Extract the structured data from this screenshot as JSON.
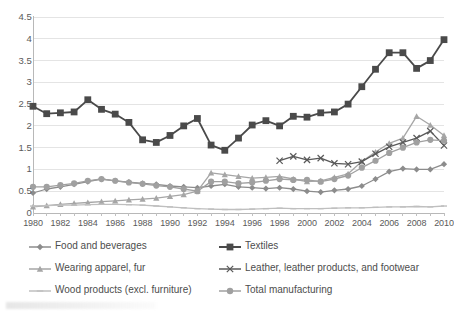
{
  "chart_data": {
    "type": "line",
    "title": "",
    "xlabel": "",
    "ylabel": "",
    "xlim": [
      1980,
      2010
    ],
    "ylim": [
      0,
      4.5
    ],
    "ytick_step": 0.5,
    "grid": "horizontal",
    "legend_position": "bottom",
    "x": [
      1980,
      1981,
      1982,
      1983,
      1984,
      1985,
      1986,
      1987,
      1988,
      1989,
      1990,
      1991,
      1992,
      1993,
      1994,
      1995,
      1996,
      1997,
      1998,
      1999,
      2000,
      2001,
      2002,
      2003,
      2004,
      2005,
      2006,
      2007,
      2008,
      2009,
      2010
    ],
    "yticks": [
      "0",
      "0.5",
      "1",
      "1.5",
      "2",
      "2.5",
      "3",
      "3.5",
      "4",
      "4.5"
    ],
    "xticks": [
      "1980",
      "1982",
      "1984",
      "1986",
      "1988",
      "1990",
      "1992",
      "1994",
      "1996",
      "1998",
      "2000",
      "2002",
      "2004",
      "2006",
      "2008",
      "2010"
    ],
    "series": [
      {
        "name": "Food and beverages",
        "marker": "diamond",
        "color": "#8c8c8c",
        "values": [
          0.46,
          0.55,
          0.6,
          0.66,
          0.72,
          0.78,
          0.74,
          0.71,
          0.68,
          0.66,
          0.62,
          0.6,
          0.58,
          0.62,
          0.66,
          0.6,
          0.58,
          0.56,
          0.58,
          0.55,
          0.5,
          0.48,
          0.52,
          0.55,
          0.62,
          0.78,
          0.95,
          1.02,
          1.0,
          1.0,
          1.12
        ]
      },
      {
        "name": "Textiles",
        "marker": "square",
        "color": "#4a4a4a",
        "values": [
          2.45,
          2.28,
          2.3,
          2.32,
          2.6,
          2.38,
          2.27,
          2.08,
          1.68,
          1.62,
          1.78,
          2.0,
          2.17,
          1.56,
          1.44,
          1.72,
          2.02,
          2.12,
          2.0,
          2.22,
          2.2,
          2.3,
          2.32,
          2.5,
          2.9,
          3.3,
          3.68,
          3.68,
          3.32,
          3.5,
          3.98
        ]
      },
      {
        "name": "Wearing apparel, fur",
        "marker": "triangle",
        "color": "#a6a6a6",
        "values": [
          0.14,
          0.17,
          0.2,
          0.22,
          0.24,
          0.26,
          0.28,
          0.3,
          0.32,
          0.34,
          0.38,
          0.42,
          0.5,
          0.92,
          0.88,
          0.84,
          0.8,
          0.82,
          0.84,
          0.78,
          0.72,
          0.74,
          0.82,
          0.9,
          1.18,
          1.4,
          1.6,
          1.72,
          2.22,
          2.02,
          1.78
        ]
      },
      {
        "name": "Leather, leather products, and footwear",
        "marker": "cross",
        "color": "#595959",
        "values": [
          null,
          null,
          null,
          null,
          null,
          null,
          null,
          null,
          null,
          null,
          null,
          null,
          null,
          null,
          null,
          null,
          null,
          null,
          1.2,
          1.3,
          1.22,
          1.26,
          1.14,
          1.12,
          1.18,
          1.36,
          1.52,
          1.62,
          1.72,
          1.88,
          1.55
        ]
      },
      {
        "name": "Wood products (excl. furniture)",
        "marker": "dash",
        "color": "#bfbfbf",
        "values": [
          0.16,
          0.17,
          0.18,
          0.18,
          0.19,
          0.2,
          0.2,
          0.19,
          0.18,
          0.16,
          0.14,
          0.12,
          0.1,
          0.09,
          0.08,
          0.08,
          0.09,
          0.1,
          0.11,
          0.1,
          0.1,
          0.1,
          0.11,
          0.12,
          0.12,
          0.13,
          0.14,
          0.14,
          0.15,
          0.14,
          0.16
        ]
      },
      {
        "name": "Total manufacturing",
        "marker": "circle",
        "color": "#a0a0a0",
        "values": [
          0.6,
          0.6,
          0.64,
          0.68,
          0.74,
          0.78,
          0.74,
          0.7,
          0.67,
          0.63,
          0.6,
          0.55,
          0.5,
          0.72,
          0.72,
          0.68,
          0.7,
          0.74,
          0.78,
          0.76,
          0.76,
          0.72,
          0.78,
          0.86,
          1.04,
          1.2,
          1.38,
          1.5,
          1.62,
          1.68,
          1.66
        ]
      }
    ]
  },
  "legend": {
    "items": [
      {
        "label": "Food and beverages"
      },
      {
        "label": "Textiles"
      },
      {
        "label": "Wearing apparel, fur"
      },
      {
        "label": "Leather, leather products, and footwear"
      },
      {
        "label": "Wood products (excl. furniture)"
      },
      {
        "label": "Total manufacturing"
      }
    ]
  }
}
